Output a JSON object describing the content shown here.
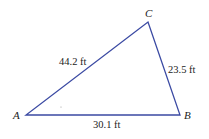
{
  "diagram": {
    "type": "triangle",
    "line_color": "#3b4aa3",
    "vertices": [
      {
        "name": "A",
        "x": 26,
        "y": 115
      },
      {
        "name": "B",
        "x": 180,
        "y": 115
      },
      {
        "name": "C",
        "x": 148,
        "y": 22
      }
    ],
    "sides": [
      {
        "between": "A-C",
        "label": "44.2 ft"
      },
      {
        "between": "C-B",
        "label": "23.5 ft"
      },
      {
        "between": "A-B",
        "label": "30.1 ft"
      }
    ]
  },
  "labels": {
    "A": "A",
    "B": "B",
    "C": "C",
    "AC": "44.2 ft",
    "CB": "23.5 ft",
    "AB": "30.1 ft"
  }
}
